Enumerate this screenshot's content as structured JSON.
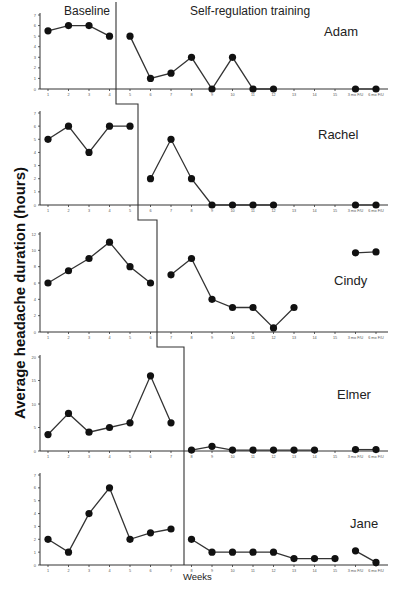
{
  "chart_data": {
    "type": "line",
    "title": "",
    "ylabel": "Average headache duration (hours)",
    "xlabel": "Weeks",
    "phase_labels": {
      "baseline": "Baseline",
      "treatment": "Self-regulation training"
    },
    "x_categories": [
      "1",
      "2",
      "3",
      "4",
      "5",
      "6",
      "7",
      "8",
      "9",
      "10",
      "11",
      "12",
      "13",
      "14",
      "15",
      "3 mo F/U",
      "6 mo F/U"
    ],
    "grid": false,
    "legend": "none",
    "panels": [
      {
        "name": "Adam",
        "ylim": [
          0,
          7
        ],
        "yticks": [
          0,
          1,
          2,
          3,
          4,
          5,
          6,
          7
        ],
        "phase_change_after_week": 4.5,
        "baseline": {
          "weeks": [
            1,
            2,
            3,
            4
          ],
          "values": [
            5.5,
            6,
            6,
            5
          ]
        },
        "treatment_segments": [
          {
            "weeks": [
              5,
              6,
              7,
              8,
              9,
              10,
              11,
              12
            ],
            "values": [
              5,
              1,
              1.5,
              3,
              0,
              3,
              0,
              0
            ]
          },
          {
            "weeks": [
              16,
              17
            ],
            "values": [
              0,
              0
            ]
          }
        ]
      },
      {
        "name": "Rachel",
        "ylim": [
          0,
          7
        ],
        "yticks": [
          0,
          1,
          2,
          3,
          4,
          5,
          6,
          7
        ],
        "phase_change_after_week": 5.5,
        "baseline": {
          "weeks": [
            1,
            2,
            3,
            4,
            5
          ],
          "values": [
            5,
            6,
            4,
            6,
            6
          ]
        },
        "treatment_segments": [
          {
            "weeks": [
              6,
              7,
              8,
              9,
              10,
              11,
              12
            ],
            "values": [
              2,
              5,
              2,
              0,
              0,
              0,
              0
            ]
          },
          {
            "weeks": [
              16,
              17
            ],
            "values": [
              0,
              0
            ]
          }
        ]
      },
      {
        "name": "Cindy",
        "ylim": [
          0,
          12
        ],
        "yticks": [
          0,
          2,
          4,
          6,
          8,
          10,
          12
        ],
        "phase_change_after_week": 6.5,
        "baseline": {
          "weeks": [
            1,
            2,
            3,
            4,
            5,
            6
          ],
          "values": [
            6,
            7.5,
            9,
            11,
            8,
            6
          ]
        },
        "treatment_segments": [
          {
            "weeks": [
              7,
              8,
              9,
              10,
              11,
              12,
              13
            ],
            "values": [
              7,
              9,
              4,
              3,
              3,
              0.5,
              3
            ]
          },
          {
            "weeks": [
              16,
              17
            ],
            "values": [
              9.7,
              9.8
            ]
          }
        ]
      },
      {
        "name": "Elmer",
        "ylim": [
          0,
          20
        ],
        "yticks": [
          0,
          5,
          10,
          15,
          20
        ],
        "phase_change_after_week": 7.5,
        "baseline": {
          "weeks": [
            1,
            2,
            3,
            4,
            5,
            6,
            7
          ],
          "values": [
            3.5,
            8,
            4,
            5,
            6,
            16,
            6
          ]
        },
        "treatment_segments": [
          {
            "weeks": [
              8,
              9,
              10,
              11,
              12,
              13,
              14
            ],
            "values": [
              0.2,
              1,
              0.2,
              0.2,
              0.2,
              0.2,
              0.2
            ]
          },
          {
            "weeks": [
              16,
              17
            ],
            "values": [
              0.3,
              0.3
            ]
          }
        ]
      },
      {
        "name": "Jane",
        "ylim": [
          0,
          7
        ],
        "yticks": [
          0,
          1,
          2,
          3,
          4,
          5,
          6,
          7
        ],
        "phase_change_after_week": 7.5,
        "baseline": {
          "weeks": [
            1,
            2,
            3,
            4,
            5,
            6,
            7
          ],
          "values": [
            2,
            1,
            4,
            6,
            2,
            2.5,
            2.8
          ]
        },
        "treatment_segments": [
          {
            "weeks": [
              8,
              9,
              10,
              11,
              12,
              13,
              14,
              15
            ],
            "values": [
              2,
              1,
              1,
              1,
              1,
              0.5,
              0.5,
              0.5
            ]
          },
          {
            "weeks": [
              16,
              17
            ],
            "values": [
              1.1,
              0.2
            ]
          }
        ]
      }
    ]
  }
}
